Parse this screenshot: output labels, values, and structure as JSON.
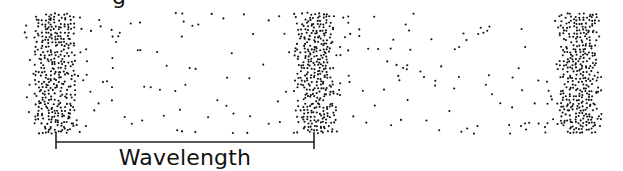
{
  "diagram": {
    "type": "longitudinal-wave-compression-rarefaction",
    "top_partial_text": "g",
    "label": "Wavelength",
    "colors": {
      "dot": "#111111",
      "bracket": "#222222",
      "background": "#ffffff"
    },
    "band": {
      "x0": 26,
      "x1": 605,
      "y0": 14,
      "y1": 135
    },
    "compressions_x": [
      55,
      316,
      580
    ],
    "bracket": {
      "x_start": 56,
      "x_end": 314,
      "y": 142,
      "tick_top": 132,
      "tick_bottom": 149
    }
  }
}
